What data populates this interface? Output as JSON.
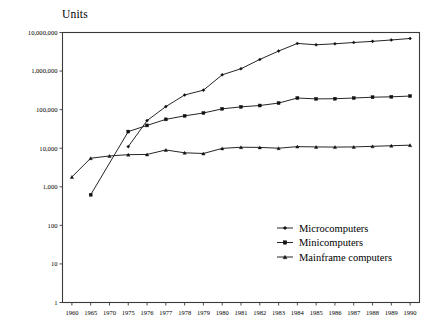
{
  "chart_data": {
    "type": "line",
    "title": "",
    "ylabel": "Units",
    "xlabel": "",
    "log_y": true,
    "grid": false,
    "legend_position": "bottom-right",
    "x": [
      "1960",
      "1965",
      "1970",
      "1975",
      "1976",
      "1977",
      "1978",
      "1979",
      "1980",
      "1981",
      "1982",
      "1983",
      "1984",
      "1985",
      "1986",
      "1987",
      "1988",
      "1989",
      "1990"
    ],
    "ylim": [
      1,
      10000000
    ],
    "ytick_labels": [
      "10,000,000",
      "1,000,000",
      "100,000",
      "10,000",
      "1,000",
      "100",
      "10",
      "1"
    ],
    "ytick_values": [
      10000000,
      1000000,
      100000,
      10000,
      1000,
      100,
      10,
      1
    ],
    "series": [
      {
        "name": "Microcomputers",
        "marker": "diamond",
        "values": [
          null,
          null,
          null,
          11000,
          52000,
          120000,
          240000,
          320000,
          800000,
          1150000,
          2000000,
          3300000,
          5200000,
          4800000,
          5100000,
          5500000,
          5900000,
          6400000,
          7000000
        ]
      },
      {
        "name": "Minicomputers",
        "marker": "square",
        "values": [
          null,
          620,
          null,
          27000,
          39000,
          56000,
          69000,
          82000,
          105000,
          118000,
          128000,
          148000,
          200000,
          190000,
          192000,
          200000,
          210000,
          215000,
          225000
        ]
      },
      {
        "name": "Mainframe computers",
        "marker": "triangle",
        "values": [
          1800,
          5500,
          6300,
          6800,
          6900,
          9000,
          7600,
          7300,
          9900,
          10600,
          10500,
          10000,
          11000,
          10800,
          10700,
          10800,
          11200,
          11600,
          12000
        ]
      }
    ],
    "legend": [
      {
        "label": "Microcomputers",
        "marker": "diamond"
      },
      {
        "label": "Minicomputers",
        "marker": "square"
      },
      {
        "label": "Mainframe computers",
        "marker": "triangle"
      }
    ],
    "colors": {
      "line": "#1a1a1a",
      "marker": "#111111",
      "axis": "#3a3a3a",
      "background": "#ffffff"
    }
  }
}
